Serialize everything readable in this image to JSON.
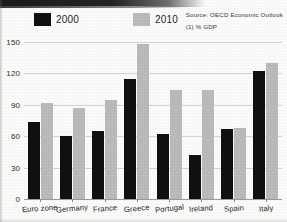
{
  "source": {
    "line1": "Source: OECD Economic Outlook",
    "line2": "(1) % GDP"
  },
  "legend": [
    {
      "label": "2000",
      "color": "#111111",
      "swatch_name": "legend-swatch-2000"
    },
    {
      "label": "2010",
      "color": "#bcbcbc",
      "swatch_name": "legend-swatch-2010"
    }
  ],
  "chart_data": {
    "type": "bar",
    "title": "",
    "subtitle": "",
    "xlabel": "",
    "ylabel": "% GDP",
    "ylim": [
      0,
      150
    ],
    "yticks": [
      0,
      30,
      60,
      90,
      120,
      150
    ],
    "ytick_labels": [
      "0",
      "30",
      "60",
      "90",
      "120",
      "150"
    ],
    "grid": true,
    "legend_position": "top-left",
    "annotations": [
      "Source: OECD Economic Outlook",
      "(1) % GDP"
    ],
    "categories": [
      "Euro zone",
      "Germany",
      "France",
      "Greece",
      "Portugal",
      "Ireland",
      "Spain",
      "Italy"
    ],
    "series": [
      {
        "name": "2000",
        "color": "#111111",
        "values": [
          74,
          60,
          65,
          115,
          62,
          42,
          67,
          122
        ]
      },
      {
        "name": "2010",
        "color": "#bcbcbc",
        "values": [
          92,
          87,
          95,
          148,
          104,
          104,
          68,
          130
        ]
      }
    ]
  }
}
